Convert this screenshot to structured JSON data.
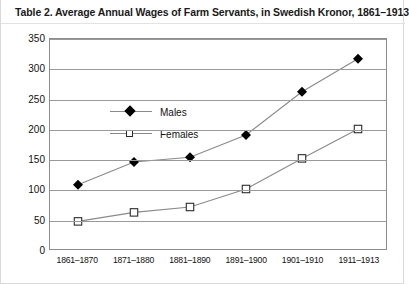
{
  "title": "Table 2. Average Annual Wages of Farm Servants, in Swedish Kronor, 1861–1913",
  "legend": {
    "males_label": "Males",
    "females_label": "Females"
  },
  "chart_data": {
    "type": "line",
    "title": "Table 2. Average Annual Wages of Farm Servants, in Swedish Kronor, 1861–1913",
    "xlabel": "",
    "ylabel": "",
    "categories": [
      "1861–1870",
      "1871–1880",
      "1881–1890",
      "1891–1900",
      "1901–1910",
      "1911–1913"
    ],
    "series": [
      {
        "name": "Males",
        "values": [
          107,
          145,
          153,
          190,
          262,
          317
        ],
        "marker": "filled-diamond",
        "color": "#000000"
      },
      {
        "name": "Females",
        "values": [
          46,
          61,
          70,
          100,
          151,
          200
        ],
        "marker": "open-square",
        "color": "#ffffff"
      }
    ],
    "ylim": [
      0,
      350
    ],
    "yticks": [
      0,
      50,
      100,
      150,
      200,
      250,
      300,
      350
    ],
    "ytick_labels": [
      "0",
      "50",
      "100",
      "150",
      "200",
      "250",
      "300",
      "350"
    ],
    "grid": true,
    "legend_position": "top-left",
    "line_color": "#8a8a8a"
  },
  "colors": {
    "line": "#8a8a8a",
    "grid": "#9a9a9a",
    "frame": "#8c8c8c",
    "text": "#111111"
  }
}
